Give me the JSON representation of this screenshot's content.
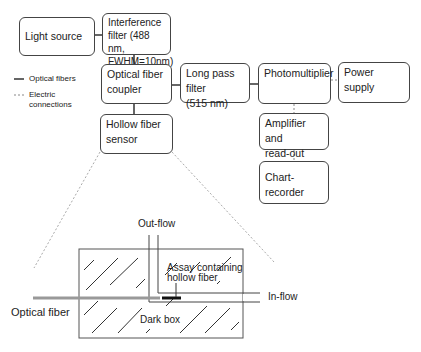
{
  "blocks": {
    "light_source": "Light source",
    "interference_filter": [
      "Interference",
      "filter (488 nm,",
      "FWHM=10nm)"
    ],
    "coupler": [
      "Optical fiber",
      "coupler"
    ],
    "long_pass": [
      "Long pass filter",
      "(515 nm)"
    ],
    "photomultiplier": "Photomultiplier",
    "power_supply": "Power supply",
    "amplifier": [
      "Amplifier and",
      "read-out"
    ],
    "chart_recorder": "Chart-recorder",
    "hollow_fiber_sensor": [
      "Hollow fiber",
      "sensor"
    ]
  },
  "legend": {
    "optical": "Optical fibers",
    "electric": [
      "Electric",
      "connections"
    ]
  },
  "detail": {
    "out_flow": "Out-flow",
    "in_flow": "In-flow",
    "assay": [
      "Assay containing",
      "hollow fiber"
    ],
    "dark_box": "Dark box",
    "optical_fiber": "Optical fiber"
  }
}
